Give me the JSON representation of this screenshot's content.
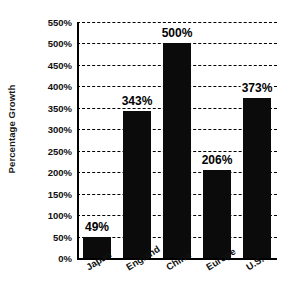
{
  "chart_data": {
    "type": "bar",
    "title": "",
    "subtitle": "",
    "xlabel": "",
    "ylabel": "Percentage Growth",
    "categories": [
      "Japan",
      "England",
      "China",
      "Europe",
      "U.S."
    ],
    "values": [
      49,
      343,
      500,
      206,
      373
    ],
    "value_labels": [
      "49%",
      "343%",
      "500%",
      "206%",
      "373%"
    ],
    "ylim": [
      0,
      550
    ],
    "ytick_values": [
      0,
      50,
      100,
      150,
      200,
      250,
      300,
      350,
      400,
      450,
      500,
      550
    ],
    "ytick_labels": [
      "0%",
      "50%",
      "100%",
      "150%",
      "200%",
      "250%",
      "300%",
      "350%",
      "400%",
      "450%",
      "500%",
      "550%"
    ],
    "grid": "horizontal-dashed",
    "legend": "none",
    "series": [
      {
        "name": "Percentage Growth",
        "values": [
          49,
          343,
          500,
          206,
          373
        ]
      }
    ],
    "colors": {
      "bar": "#0b0b0b",
      "background": "#ffffff",
      "gridline": "#000000",
      "axis": "#000000",
      "text": "#111111"
    }
  }
}
